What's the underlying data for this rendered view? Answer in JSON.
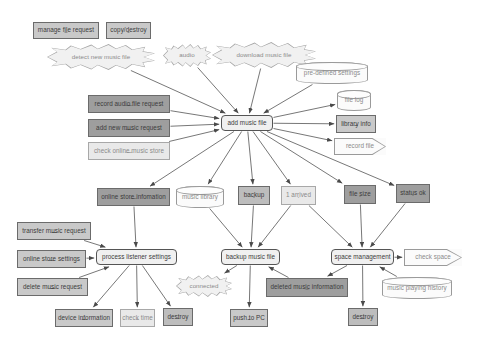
{
  "diagram": {
    "background": "#ffffff",
    "edge_color": "#4a4a4a",
    "shape_legend": {
      "envelope": "message / request",
      "process": "process (rounded rectangle)",
      "cylinder": "data store",
      "pentagon": "output / report",
      "burst": "event trigger"
    },
    "nodes": [
      {
        "id": "manage-file-request",
        "label": "manage file request",
        "shape": "envelope",
        "fill": "#c9c9c9",
        "x": 33,
        "y": 22,
        "w": 66,
        "h": 17
      },
      {
        "id": "copy-destroy",
        "label": "copy/destroy",
        "shape": "envelope",
        "fill": "#c9c9c9",
        "x": 106,
        "y": 22,
        "w": 45,
        "h": 17
      },
      {
        "id": "detect-new-music-file",
        "label": "detect new music file",
        "shape": "burst",
        "fill": "#f1f1f1",
        "x": 47,
        "y": 44,
        "w": 108,
        "h": 26
      },
      {
        "id": "audio",
        "label": "audio",
        "shape": "burst",
        "fill": "#f1f1f1",
        "x": 163,
        "y": 44,
        "w": 48,
        "h": 23
      },
      {
        "id": "download-music-file",
        "label": "download music file",
        "shape": "burst",
        "fill": "#e6e6e6",
        "x": 212,
        "y": 42,
        "w": 104,
        "h": 26
      },
      {
        "id": "pre-defined-settings",
        "label": "pre-defined settings",
        "shape": "cylinder",
        "fill": "#fbfbfb",
        "x": 296,
        "y": 62,
        "w": 72,
        "h": 22
      },
      {
        "id": "record-audio-file-request",
        "label": "record audio file request",
        "shape": "envelope",
        "fill": "#9e9e9e",
        "x": 88,
        "y": 95,
        "w": 82,
        "h": 18
      },
      {
        "id": "file-log",
        "label": "file log",
        "shape": "cylinder",
        "fill": "#fbfbfb",
        "x": 337,
        "y": 90,
        "w": 34,
        "h": 21
      },
      {
        "id": "add-new-music-request",
        "label": "add new music request",
        "shape": "envelope",
        "fill": "#9e9e9e",
        "x": 88,
        "y": 119,
        "w": 82,
        "h": 18
      },
      {
        "id": "add-music-file",
        "label": "add music file",
        "shape": "process",
        "fill": "#f0f0f0",
        "x": 221,
        "y": 115,
        "w": 52,
        "h": 16
      },
      {
        "id": "library-info",
        "label": "library info",
        "shape": "envelope",
        "fill": "#c9c9c9",
        "x": 336,
        "y": 115,
        "w": 40,
        "h": 18
      },
      {
        "id": "check-online-music-store",
        "label": "check online music store",
        "shape": "envelope",
        "fill": "#e9e9e9",
        "x": 88,
        "y": 142,
        "w": 82,
        "h": 18
      },
      {
        "id": "record-file",
        "label": "record file",
        "shape": "pentagon",
        "fill": "#fbfbfb",
        "x": 334,
        "y": 138,
        "w": 52,
        "h": 17
      },
      {
        "id": "online-store-information",
        "label": "online store infomation",
        "shape": "envelope",
        "fill": "#9e9e9e",
        "x": 97,
        "y": 188,
        "w": 73,
        "h": 18
      },
      {
        "id": "music-library",
        "label": "music library",
        "shape": "cylinder",
        "fill": "#fbfbfb",
        "x": 176,
        "y": 186,
        "w": 48,
        "h": 22
      },
      {
        "id": "backup",
        "label": "backup",
        "shape": "envelope",
        "fill": "#bdbdbd",
        "x": 238,
        "y": 186,
        "w": 32,
        "h": 19
      },
      {
        "id": "1-arrived",
        "label": "1 arrived",
        "shape": "envelope",
        "fill": "#e9e9e9",
        "x": 281,
        "y": 186,
        "w": 35,
        "h": 19
      },
      {
        "id": "file-size",
        "label": "file size",
        "shape": "envelope",
        "fill": "#9e9e9e",
        "x": 344,
        "y": 185,
        "w": 32,
        "h": 19
      },
      {
        "id": "status-ok",
        "label": "status ok",
        "shape": "envelope",
        "fill": "#9e9e9e",
        "x": 396,
        "y": 184,
        "w": 34,
        "h": 19
      },
      {
        "id": "transfer-music-request",
        "label": "transfer music request",
        "shape": "envelope",
        "fill": "#c9c9c9",
        "x": 17,
        "y": 222,
        "w": 74,
        "h": 18
      },
      {
        "id": "process-listener-settings",
        "label": "process listener settings",
        "shape": "process",
        "fill": "#f0f0f0",
        "x": 96,
        "y": 249,
        "w": 81,
        "h": 16
      },
      {
        "id": "online-store-settings",
        "label": "online store settings",
        "shape": "envelope",
        "fill": "#c9c9c9",
        "x": 17,
        "y": 250,
        "w": 69,
        "h": 18
      },
      {
        "id": "backup-music-file",
        "label": "backup music file",
        "shape": "process",
        "fill": "#f0f0f0",
        "x": 221,
        "y": 249,
        "w": 59,
        "h": 16
      },
      {
        "id": "space-management",
        "label": "space management",
        "shape": "process",
        "fill": "#f0f0f0",
        "x": 331,
        "y": 249,
        "w": 63,
        "h": 16
      },
      {
        "id": "check-space",
        "label": "check space",
        "shape": "pentagon",
        "fill": "#fbfbfb",
        "x": 404,
        "y": 249,
        "w": 58,
        "h": 17
      },
      {
        "id": "delete-music-request",
        "label": "delete music request",
        "shape": "envelope",
        "fill": "#c9c9c9",
        "x": 17,
        "y": 278,
        "w": 71,
        "h": 18
      },
      {
        "id": "connected",
        "label": "connected",
        "shape": "burst",
        "fill": "#f1f1f1",
        "x": 176,
        "y": 275,
        "w": 56,
        "h": 22
      },
      {
        "id": "deleted-music-information",
        "label": "deleted music information",
        "shape": "envelope",
        "fill": "#9e9e9e",
        "x": 266,
        "y": 278,
        "w": 82,
        "h": 19
      },
      {
        "id": "music-playing-history",
        "label": "music playing history",
        "shape": "cylinder",
        "fill": "#fbfbfb",
        "x": 382,
        "y": 277,
        "w": 70,
        "h": 22
      },
      {
        "id": "device-information",
        "label": "device information",
        "shape": "envelope",
        "fill": "#c9c9c9",
        "x": 55,
        "y": 309,
        "w": 58,
        "h": 18
      },
      {
        "id": "check-time",
        "label": "check time",
        "shape": "envelope",
        "fill": "#e9e9e9",
        "x": 120,
        "y": 309,
        "w": 35,
        "h": 18
      },
      {
        "id": "destroy-left",
        "label": "destroy",
        "shape": "envelope",
        "fill": "#bdbdbd",
        "x": 163,
        "y": 308,
        "w": 30,
        "h": 18
      },
      {
        "id": "push-to-pc",
        "label": "push to PC",
        "shape": "envelope",
        "fill": "#c9c9c9",
        "x": 230,
        "y": 309,
        "w": 38,
        "h": 18
      },
      {
        "id": "destroy-right",
        "label": "destroy",
        "shape": "envelope",
        "fill": "#bdbdbd",
        "x": 348,
        "y": 308,
        "w": 30,
        "h": 18
      }
    ],
    "edges": [
      {
        "from": "detect-new-music-file",
        "to": "add-music-file"
      },
      {
        "from": "audio",
        "to": "add-music-file"
      },
      {
        "from": "download-music-file",
        "to": "add-music-file"
      },
      {
        "from": "pre-defined-settings",
        "to": "add-music-file"
      },
      {
        "from": "record-audio-file-request",
        "to": "add-music-file"
      },
      {
        "from": "add-new-music-request",
        "to": "add-music-file"
      },
      {
        "from": "check-online-music-store",
        "to": "add-music-file"
      },
      {
        "from": "add-music-file",
        "to": "file-log"
      },
      {
        "from": "add-music-file",
        "to": "library-info"
      },
      {
        "from": "add-music-file",
        "to": "record-file"
      },
      {
        "from": "add-music-file",
        "to": "online-store-information"
      },
      {
        "from": "add-music-file",
        "to": "music-library"
      },
      {
        "from": "add-music-file",
        "to": "backup"
      },
      {
        "from": "add-music-file",
        "to": "1-arrived"
      },
      {
        "from": "add-music-file",
        "to": "file-size"
      },
      {
        "from": "add-music-file",
        "to": "status-ok"
      },
      {
        "from": "online-store-information",
        "to": "process-listener-settings"
      },
      {
        "from": "music-library",
        "to": "backup-music-file"
      },
      {
        "from": "backup",
        "to": "backup-music-file"
      },
      {
        "from": "1-arrived",
        "to": "backup-music-file"
      },
      {
        "from": "1-arrived",
        "to": "space-management"
      },
      {
        "from": "file-size",
        "to": "space-management"
      },
      {
        "from": "status-ok",
        "to": "space-management"
      },
      {
        "from": "transfer-music-request",
        "to": "process-listener-settings"
      },
      {
        "from": "online-store-settings",
        "to": "process-listener-settings"
      },
      {
        "from": "delete-music-request",
        "to": "process-listener-settings"
      },
      {
        "from": "process-listener-settings",
        "to": "device-information"
      },
      {
        "from": "process-listener-settings",
        "to": "check-time"
      },
      {
        "from": "process-listener-settings",
        "to": "destroy-left"
      },
      {
        "from": "backup-music-file",
        "to": "connected"
      },
      {
        "from": "backup-music-file",
        "to": "push-to-pc"
      },
      {
        "from": "space-management",
        "to": "check-space"
      },
      {
        "from": "space-management",
        "to": "deleted-music-information"
      },
      {
        "from": "space-management",
        "to": "destroy-right"
      },
      {
        "from": "deleted-music-information",
        "to": "backup-music-file"
      },
      {
        "from": "music-playing-history",
        "to": "space-management"
      }
    ]
  }
}
